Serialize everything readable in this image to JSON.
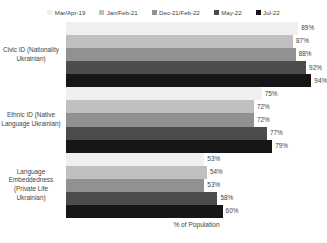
{
  "chart_data": {
    "type": "bar",
    "orientation": "horizontal",
    "title": "",
    "xlabel": "% of Population",
    "ylabel": "",
    "xlim": [
      0,
      100
    ],
    "grid": false,
    "legend_position": "top",
    "value_suffix": "%",
    "categories": [
      "Civic ID (Nationality Ukrainian)",
      "Ethnic ID (Native Language Ukrainian)",
      "Language Embeddedness (Private Life Ukrainian)"
    ],
    "series": [
      {
        "name": "Mar/Apr-19",
        "color": "#efefef",
        "values": [
          89,
          75,
          53
        ]
      },
      {
        "name": "Jan/Feb-21",
        "color": "#bfbfbf",
        "values": [
          87,
          72,
          54
        ]
      },
      {
        "name": "Dec-21/Feb-22",
        "color": "#919191",
        "values": [
          88,
          72,
          53
        ]
      },
      {
        "name": "May-22",
        "color": "#4c4c4c",
        "values": [
          92,
          77,
          58
        ]
      },
      {
        "name": "Jul-22",
        "color": "#161616",
        "values": [
          94,
          79,
          60
        ]
      }
    ],
    "data_labels": [
      [
        "89%",
        "87%",
        "88%",
        "92%",
        "94%"
      ],
      [
        "75%",
        "72%",
        "72%",
        "77%",
        "79%"
      ],
      [
        "53%",
        "54%",
        "53%",
        "58%",
        "60%"
      ]
    ]
  }
}
